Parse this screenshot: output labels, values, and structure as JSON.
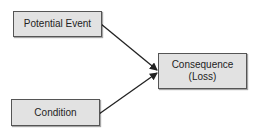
{
  "diagram": {
    "nodes": [
      {
        "id": "potential-event",
        "label": "Potential Event"
      },
      {
        "id": "condition",
        "label": "Condition"
      },
      {
        "id": "consequence",
        "label_line1": "Consequence",
        "label_line2": "(Loss)"
      }
    ],
    "edges": [
      {
        "from": "potential-event",
        "to": "consequence"
      },
      {
        "from": "condition",
        "to": "consequence"
      }
    ]
  }
}
